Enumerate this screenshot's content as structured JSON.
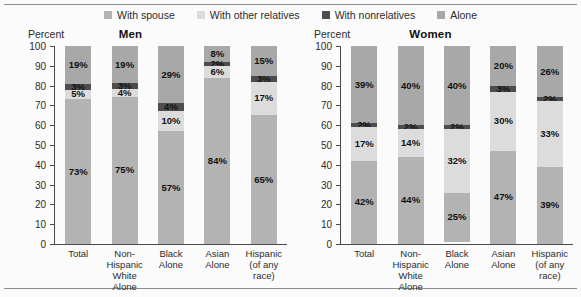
{
  "legend": {
    "items": [
      {
        "label": "With spouse",
        "color": "#b3b3b3",
        "key": "with_spouse"
      },
      {
        "label": "With other relatives",
        "color": "#dcdcdc",
        "key": "with_other_relatives"
      },
      {
        "label": "With nonrelatives",
        "color": "#4d4d4d",
        "key": "with_nonrelatives"
      },
      {
        "label": "Alone",
        "color": "#a8a8a8",
        "key": "alone"
      }
    ]
  },
  "axis": {
    "percent_label": "Percent",
    "ticks": [
      "100",
      "90",
      "80",
      "70",
      "60",
      "50",
      "40",
      "30",
      "20",
      "10",
      "0"
    ]
  },
  "panels": [
    {
      "id": "men",
      "title": "Men"
    },
    {
      "id": "women",
      "title": "Women"
    }
  ],
  "categories": [
    {
      "lines": [
        "Total"
      ]
    },
    {
      "lines": [
        "Non-Hispanic",
        "White Alone"
      ]
    },
    {
      "lines": [
        "Black",
        "Alone"
      ]
    },
    {
      "lines": [
        "Asian",
        "Alone"
      ]
    },
    {
      "lines": [
        "Hispanic",
        "(of any race)"
      ]
    }
  ],
  "chart_data": {
    "type": "bar",
    "subtype": "stacked-100",
    "xlabel": "",
    "ylabel": "Percent",
    "ylim": [
      0,
      100
    ],
    "ytick_step": 10,
    "grid": false,
    "legend_position": "top-center",
    "series_order": [
      "With spouse",
      "With other relatives",
      "With nonrelatives",
      "Alone"
    ],
    "categories": [
      "Total",
      "Non-Hispanic White Alone",
      "Black Alone",
      "Asian Alone",
      "Hispanic (of any race)"
    ],
    "panels": [
      {
        "name": "Men",
        "series": [
          {
            "name": "With spouse",
            "values": [
              73,
              75,
              57,
              84,
              65
            ],
            "labels": [
              "73%",
              "75%",
              "57%",
              "84%",
              "65%"
            ]
          },
          {
            "name": "With other relatives",
            "values": [
              5,
              4,
              10,
              6,
              17
            ],
            "labels": [
              "5%",
              "4%",
              "10%",
              "6%",
              "17%"
            ]
          },
          {
            "name": "With nonrelatives",
            "values": [
              3,
              3,
              4,
              2,
              3
            ],
            "labels": [
              "3%",
              "3%",
              "4%",
              "2%",
              "3%"
            ]
          },
          {
            "name": "Alone",
            "values": [
              19,
              19,
              29,
              8,
              15
            ],
            "labels": [
              "19%",
              "19%",
              "29%",
              "8%",
              "15%"
            ]
          }
        ]
      },
      {
        "name": "Women",
        "series": [
          {
            "name": "With spouse",
            "values": [
              42,
              44,
              25,
              47,
              39
            ],
            "labels": [
              "42%",
              "44%",
              "25%",
              "47%",
              "39%"
            ]
          },
          {
            "name": "With other relatives",
            "values": [
              17,
              14,
              32,
              30,
              33
            ],
            "labels": [
              "17%",
              "14%",
              "32%",
              "30%",
              "33%"
            ]
          },
          {
            "name": "With nonrelatives",
            "values": [
              2,
              2,
              2,
              3,
              2
            ],
            "labels": [
              "2%",
              "2%",
              "2%",
              "3%",
              "2%"
            ]
          },
          {
            "name": "Alone",
            "values": [
              39,
              40,
              40,
              20,
              26
            ],
            "labels": [
              "39%",
              "40%",
              "40%",
              "20%",
              "26%"
            ]
          }
        ]
      }
    ]
  }
}
